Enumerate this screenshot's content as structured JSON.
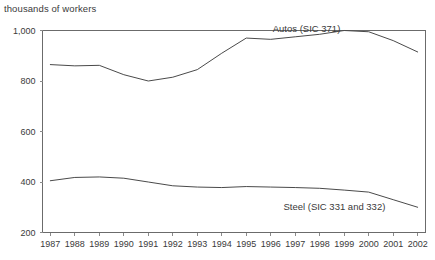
{
  "chart_data": {
    "type": "line",
    "title": "thousands of workers",
    "xlabel": "",
    "ylabel": "thousands of workers",
    "grid": false,
    "legend_position": "inline-annotation",
    "xlim": [
      1987,
      2002
    ],
    "ylim": [
      200,
      1000
    ],
    "yticks": [
      200,
      400,
      600,
      800,
      1000
    ],
    "ytick_labels": [
      "200",
      "400",
      "600",
      "800",
      "1,000"
    ],
    "categories": [
      1987,
      1988,
      1989,
      1990,
      1991,
      1992,
      1993,
      1994,
      1995,
      1996,
      1997,
      1998,
      1999,
      2000,
      2001,
      2002
    ],
    "xtick_labels": [
      "1987",
      "1988",
      "1989",
      "1990",
      "1991",
      "1992",
      "1993",
      "1994",
      "1995",
      "1996",
      "1997",
      "1998",
      "1999",
      "2000",
      "2001",
      "2002"
    ],
    "series": [
      {
        "name": "Autos (SIC 371)",
        "label": "Autos (SIC 371)",
        "color": "#4a4a4a",
        "values": [
          865,
          860,
          862,
          825,
          800,
          815,
          845,
          910,
          970,
          965,
          975,
          985,
          1000,
          995,
          960,
          915
        ]
      },
      {
        "name": "Steel (SIC 331 and 332)",
        "label": "Steel (SIC 331 and 332)",
        "color": "#4a4a4a",
        "values": [
          405,
          418,
          420,
          415,
          400,
          385,
          380,
          378,
          382,
          380,
          378,
          375,
          368,
          360,
          330,
          300
        ]
      }
    ]
  },
  "annotations": {
    "autos_label": "Autos (SIC 371)",
    "steel_label": "Steel (SIC 331 and 332)"
  }
}
